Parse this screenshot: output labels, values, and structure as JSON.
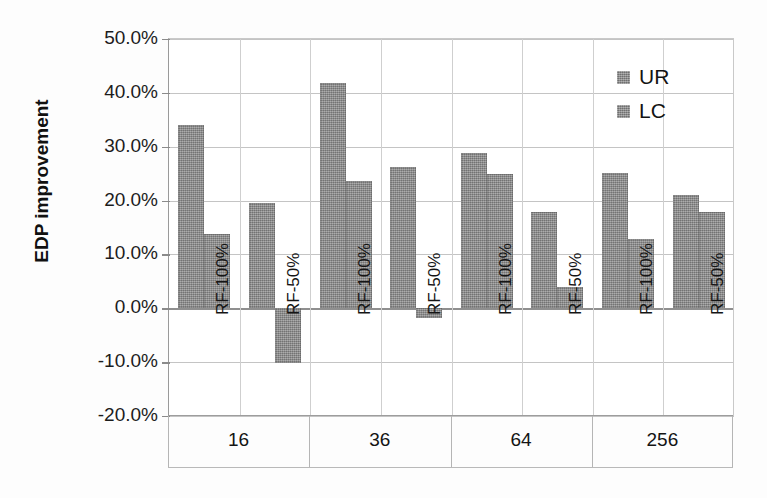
{
  "chart_data": {
    "type": "bar",
    "title": "",
    "xlabel": "",
    "ylabel": "EDP improvement",
    "ylim": [
      -20,
      50
    ],
    "ytick_labels": [
      "50.0%",
      "40.0%",
      "30.0%",
      "20.0%",
      "10.0%",
      "0.0%",
      "-10.0%",
      "-20.0%"
    ],
    "ytick_values": [
      50,
      40,
      30,
      20,
      10,
      0,
      -10,
      -20
    ],
    "grid": true,
    "legend_position": "top-right",
    "group_label_name": "",
    "groups": [
      "16",
      "36",
      "64",
      "256"
    ],
    "subcategories": [
      "RF-100%",
      "RF-50%"
    ],
    "categories": [
      "16 / RF-100%",
      "16 / RF-50%",
      "36 / RF-100%",
      "36 / RF-50%",
      "64 / RF-100%",
      "64 / RF-50%",
      "256 / RF-100%",
      "256 / RF-50%"
    ],
    "series": [
      {
        "name": "UR",
        "color": "#8d8d8d",
        "values": [
          34.1,
          19.5,
          41.8,
          26.2,
          28.8,
          17.9,
          25.2,
          21.1
        ]
      },
      {
        "name": "LC",
        "color": "#8d8d8d",
        "values": [
          13.8,
          -10.2,
          23.6,
          -1.8,
          24.9,
          4.0,
          12.9,
          17.9
        ]
      }
    ]
  },
  "legend": {
    "items": [
      {
        "label": "UR"
      },
      {
        "label": "LC"
      }
    ]
  },
  "axis": {
    "y_title": "EDP improvement"
  }
}
